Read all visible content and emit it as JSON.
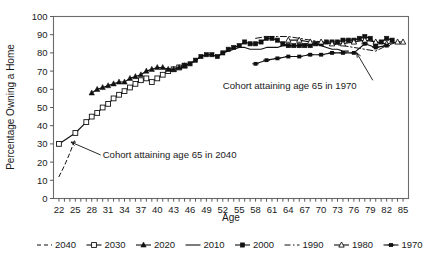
{
  "chart_data": {
    "type": "line",
    "title": "",
    "xlabel": "Age",
    "ylabel": "Percentage Owning a Home",
    "xlim": [
      21,
      86
    ],
    "ylim": [
      0,
      100
    ],
    "ytick_step": 10,
    "xtick_step": 3,
    "grid": false,
    "legend_position": "bottom",
    "x_tick_labels": [
      "22",
      "25",
      "28",
      "31",
      "34",
      "37",
      "40",
      "43",
      "46",
      "49",
      "52",
      "55",
      "58",
      "61",
      "64",
      "67",
      "70",
      "73",
      "76",
      "79",
      "82",
      "85"
    ],
    "y_tick_labels": [
      "0",
      "10",
      "20",
      "30",
      "40",
      "50",
      "60",
      "70",
      "80",
      "90",
      "100"
    ],
    "annotations": [
      {
        "text": "Cohort attaining age 65 in 2040",
        "x": 30,
        "y": 22,
        "target_x": 24.2,
        "target_y": 31
      },
      {
        "text": "Cohort attaining age 65 in 1970",
        "x": 52,
        "y": 60,
        "target_x": 76.5,
        "target_y": 80
      }
    ],
    "legend": [
      {
        "name": "2040",
        "style": "dashed",
        "marker": "none"
      },
      {
        "name": "2030",
        "style": "solid",
        "marker": "open-square"
      },
      {
        "name": "2020",
        "style": "solid",
        "marker": "triangle"
      },
      {
        "name": "2010",
        "style": "solid",
        "marker": "none"
      },
      {
        "name": "2000",
        "style": "solid",
        "marker": "filled-square"
      },
      {
        "name": "1990",
        "style": "dash-dot",
        "marker": "none"
      },
      {
        "name": "1980",
        "style": "solid",
        "marker": "open-triangle"
      },
      {
        "name": "1970",
        "style": "solid",
        "marker": "plus-filled"
      }
    ],
    "series": [
      {
        "name": "2040",
        "style": "dashed",
        "marker": "none",
        "x": [
          22,
          23,
          24,
          25
        ],
        "values": [
          12,
          18,
          25,
          33
        ]
      },
      {
        "name": "2030",
        "style": "solid",
        "marker": "open-square",
        "x": [
          22,
          25,
          27,
          28,
          29,
          30,
          31,
          32,
          33,
          34,
          35,
          36,
          37,
          38,
          39,
          40,
          41,
          42,
          43,
          44,
          45
        ],
        "values": [
          30,
          36,
          42,
          45,
          47,
          50,
          52,
          55,
          57,
          59,
          61,
          63,
          65,
          66,
          64,
          66,
          68,
          70,
          71,
          72,
          73
        ]
      },
      {
        "name": "2020",
        "style": "solid",
        "marker": "triangle",
        "x": [
          28,
          29,
          30,
          31,
          32,
          33,
          34,
          35,
          36,
          37,
          38,
          39,
          40,
          41,
          42,
          43,
          44,
          45
        ],
        "values": [
          58,
          60,
          61,
          62,
          63,
          64,
          64,
          66,
          67,
          68,
          70,
          71,
          72,
          72,
          71,
          71,
          72,
          73
        ]
      },
      {
        "name": "2010",
        "style": "solid",
        "marker": "none",
        "x": [
          45,
          46,
          47,
          48,
          49,
          50,
          51,
          52,
          53,
          54,
          55,
          56,
          57,
          58,
          59,
          60,
          61,
          62,
          63,
          64,
          65,
          66,
          67,
          68,
          69,
          70,
          71,
          72,
          73,
          74,
          75
        ],
        "values": [
          73,
          74,
          76,
          78,
          79,
          79,
          78,
          80,
          81,
          82,
          83,
          83,
          82,
          82,
          82,
          83,
          83,
          83,
          84,
          84,
          84,
          84,
          85,
          85,
          85,
          84,
          83,
          82,
          82,
          81,
          81
        ]
      },
      {
        "name": "2000",
        "style": "solid",
        "marker": "filled-square",
        "x": [
          45,
          46,
          47,
          48,
          49,
          50,
          51,
          52,
          53,
          54,
          55,
          56,
          57,
          58,
          59,
          60,
          61,
          62,
          63,
          64,
          65,
          66,
          67,
          68,
          69,
          70,
          71,
          72,
          73,
          74,
          75,
          76,
          77,
          78,
          79,
          80,
          81,
          82,
          83
        ],
        "values": [
          73,
          74,
          76,
          78,
          79,
          79,
          78,
          80,
          82,
          83,
          84,
          86,
          85,
          85,
          86,
          88,
          88,
          87,
          85,
          84,
          84,
          84,
          84,
          84,
          85,
          85,
          86,
          86,
          86,
          87,
          87,
          87,
          88,
          89,
          88,
          85,
          86,
          88,
          87
        ]
      },
      {
        "name": "1990",
        "style": "dash-dot",
        "marker": "none",
        "x": [
          58,
          60,
          62,
          64,
          66,
          68,
          70,
          72,
          74,
          76,
          78,
          80,
          82,
          84,
          85
        ],
        "values": [
          88,
          89,
          89,
          89,
          88,
          87,
          86,
          85,
          84,
          83,
          82,
          81,
          84,
          86,
          86
        ]
      },
      {
        "name": "1980",
        "style": "solid",
        "marker": "open-triangle",
        "x": [
          64,
          66,
          68,
          70,
          72,
          74,
          76,
          78,
          80,
          82,
          84,
          85
        ],
        "values": [
          87,
          87,
          86,
          86,
          85,
          85,
          86,
          87,
          86,
          85,
          86,
          86
        ]
      },
      {
        "name": "1970",
        "style": "solid",
        "marker": "plus-filled",
        "x": [
          58,
          60,
          62,
          64,
          66,
          68,
          70,
          72,
          74,
          76,
          78,
          80,
          82
        ],
        "values": [
          74,
          76,
          77,
          78,
          78,
          79,
          79,
          80,
          80,
          80,
          85,
          83,
          84
        ]
      }
    ]
  },
  "axis": {
    "x_title": "Age",
    "y_title": "Percentage Owning a Home"
  }
}
